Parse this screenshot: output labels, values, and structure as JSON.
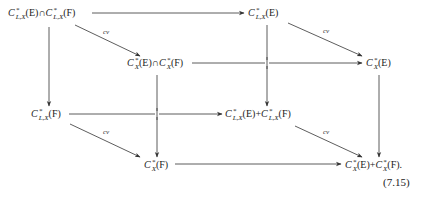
{
  "diagram": {
    "type": "commutative-cube",
    "nodes": {
      "A": {
        "base": "C",
        "sup": "*",
        "sub": "L,X",
        "arg": "(E)",
        "op": "∩",
        "base2": "C",
        "sup2": "*",
        "sub2": "L,X",
        "arg2": "(F)",
        "text": "C*_{L,X}(E) ∩ C*_{L,X}(F)"
      },
      "B": {
        "base": "C",
        "sup": "*",
        "sub": "L,X",
        "arg": "(E)",
        "text": "C*_{L,X}(E)"
      },
      "C": {
        "base": "C",
        "sup": "*",
        "sub": "X",
        "arg": "(E)",
        "op": "∩",
        "base2": "C",
        "sup2": "*",
        "sub2": "X",
        "arg2": "(F)",
        "text": "C*_X(E) ∩ C*_X(F)"
      },
      "D": {
        "base": "C",
        "sup": "*",
        "sub": "X",
        "arg": "(E)",
        "text": "C*_X(E)"
      },
      "E": {
        "base": "C",
        "sup": "*",
        "sub": "L,X",
        "arg": "(F)",
        "text": "C*_{L,X}(F)"
      },
      "F": {
        "base": "C",
        "sup": "*",
        "sub": "L,X",
        "arg": "(E)",
        "op": "+",
        "base2": "C",
        "sup2": "*",
        "sub2": "L,X",
        "arg2": "(F)",
        "text": "C*_{L,X}(E) + C*_{L,X}(F)"
      },
      "G": {
        "base": "C",
        "sup": "*",
        "sub": "X",
        "arg": "(F)",
        "text": "C*_X(F)"
      },
      "H": {
        "base": "C",
        "sup": "*",
        "sub": "X",
        "arg": "(E)",
        "op": "+",
        "base2": "C",
        "sup2": "*",
        "sub2": "X",
        "arg2": "(F)",
        "trail": ".",
        "text": "C*_X(E) + C*_X(F)."
      }
    },
    "edges": [
      {
        "from": "A",
        "to": "B",
        "label": ""
      },
      {
        "from": "A",
        "to": "C",
        "label": "cv"
      },
      {
        "from": "A",
        "to": "E",
        "label": ""
      },
      {
        "from": "B",
        "to": "D",
        "label": "cv"
      },
      {
        "from": "B",
        "to": "F",
        "label": ""
      },
      {
        "from": "C",
        "to": "D",
        "label": ""
      },
      {
        "from": "C",
        "to": "G",
        "label": ""
      },
      {
        "from": "D",
        "to": "H",
        "label": ""
      },
      {
        "from": "E",
        "to": "F",
        "label": ""
      },
      {
        "from": "E",
        "to": "G",
        "label": "cv"
      },
      {
        "from": "F",
        "to": "H",
        "label": "cv"
      },
      {
        "from": "G",
        "to": "H",
        "label": ""
      }
    ],
    "edge_labels": {
      "cv": "cv"
    },
    "equation_number": "(7.15)"
  }
}
